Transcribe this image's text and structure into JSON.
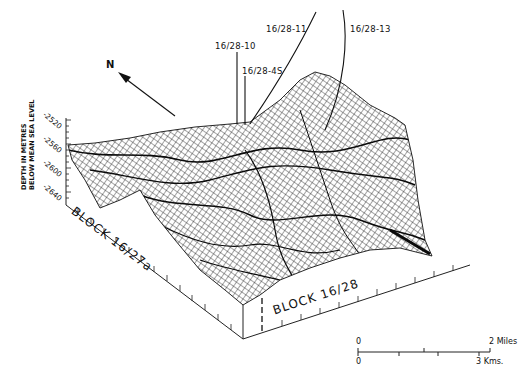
{
  "figure": {
    "type": "3D wireframe surface map",
    "north_label": "N",
    "vertical_axis": {
      "title_line1": "DEPTH IN METRES",
      "title_line2": "BELOW MEAN SEA LEVEL",
      "ticks": [
        "-2520",
        "-2560",
        "-2600",
        "-2640"
      ]
    },
    "wells": [
      {
        "id": "w10",
        "label": "16/28-10"
      },
      {
        "id": "w4s",
        "label": "16/28-4S"
      },
      {
        "id": "w11",
        "label": "16/28-11"
      },
      {
        "id": "w13",
        "label": "16/28-13"
      }
    ],
    "blocks": [
      {
        "id": "left",
        "label": "BLOCK 16/27a"
      },
      {
        "id": "right",
        "label": "BLOCK 16/28"
      }
    ],
    "scale_bar": {
      "miles_start": "0",
      "miles_end": "2 Miles",
      "km_start": "0",
      "km_end": "3 Kms."
    },
    "colors": {
      "ink": "#111111",
      "background": "#ffffff"
    }
  }
}
